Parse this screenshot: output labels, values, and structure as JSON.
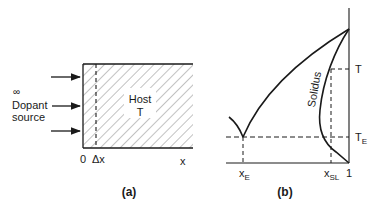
{
  "panel_a": {
    "caption": "(a)",
    "infinity_symbol": "∞",
    "source_label_line1": "Dopant",
    "source_label_line2": "source",
    "host_label": "Host",
    "host_temp_label": "T",
    "axis_origin": "0",
    "axis_delta": "Δx",
    "axis_x": "x",
    "arrow_count": 3
  },
  "panel_b": {
    "caption": "(b)",
    "curve_label": "Solidus",
    "label_T": "T",
    "label_TE_main": "T",
    "label_TE_sub": "E",
    "label_xE_main": "x",
    "label_xE_sub": "E",
    "label_xSL_main": "x",
    "label_xSL_sub": "SL",
    "label_one": "1"
  },
  "colors": {
    "ink": "#1a1a1a",
    "hatch": "#555555",
    "background": "#ffffff"
  }
}
